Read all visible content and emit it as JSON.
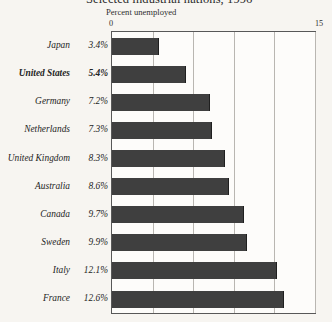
{
  "chart_data": {
    "type": "bar",
    "orientation": "horizontal",
    "title": "Selected industrial nations, 1996",
    "subtitle": "Percent unemployed",
    "xlabel": "",
    "ylabel": "",
    "xlim": [
      0,
      15
    ],
    "axis_ticks": [
      "0",
      "15"
    ],
    "axis_min_label": "0",
    "axis_max_label": "15",
    "gridlines": [
      0,
      3,
      6,
      9,
      12,
      15
    ],
    "grid": true,
    "legend": "none",
    "bar_color": "#3f3f3f",
    "plot_background": "#fdfcfa",
    "page_background": "#f7f5f1",
    "highlight_category": "United States",
    "categories": [
      "Japan",
      "United States",
      "Germany",
      "Netherlands",
      "United Kingdom",
      "Australia",
      "Canada",
      "Sweden",
      "Italy",
      "France"
    ],
    "values": [
      3.4,
      5.4,
      7.2,
      7.3,
      8.3,
      8.6,
      9.7,
      9.9,
      12.1,
      12.6
    ],
    "value_labels": [
      "3.4%",
      "5.4%",
      "7.2%",
      "7.3%",
      "8.3%",
      "8.6%",
      "9.7%",
      "9.9%",
      "12.1%",
      "12.6%"
    ]
  }
}
